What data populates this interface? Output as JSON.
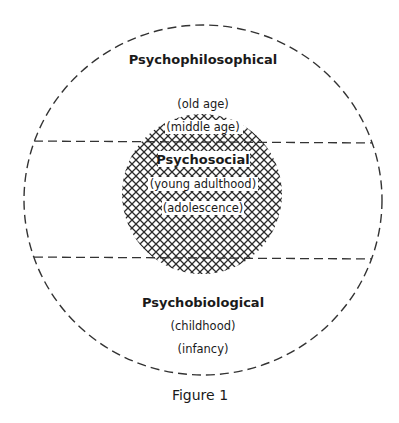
{
  "diagram": {
    "regions": {
      "top": {
        "title": "Psychophilosophical",
        "stages": [
          "(old age)"
        ]
      },
      "middle": {
        "title": "Psychosocial",
        "stages": [
          "(middle age)",
          "(young adulthood)",
          "(adolescence)"
        ]
      },
      "bottom": {
        "title": "Psychobiological",
        "stages": [
          "(childhood)",
          "(infancy)"
        ]
      }
    },
    "caption": "Figure 1",
    "colors": {
      "line": "#333333",
      "hatch": "#2b2b2b",
      "text": "#1a1a1a",
      "background": "#ffffff"
    }
  }
}
